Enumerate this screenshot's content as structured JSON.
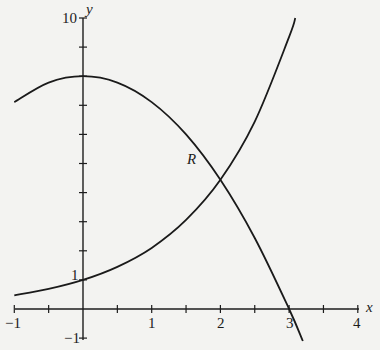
{
  "chart_data": {
    "type": "line",
    "title": "",
    "xlabel": "x",
    "ylabel": "y",
    "xlim": [
      -1,
      4
    ],
    "ylim": [
      -1,
      10
    ],
    "grid": false,
    "x_ticks": [
      -1,
      -0.5,
      0,
      0.5,
      1,
      1.5,
      2,
      2.5,
      3,
      3.5,
      4
    ],
    "x_tick_labels": [
      "-1",
      "1",
      "2",
      "3",
      "4"
    ],
    "x_tick_label_values": [
      -1,
      1,
      2,
      3,
      4
    ],
    "y_ticks": [
      -1,
      0,
      1,
      2,
      3,
      4,
      5,
      6,
      7,
      8,
      9,
      10
    ],
    "y_tick_labels": [
      "10",
      "1",
      "-1"
    ],
    "y_tick_label_values": [
      10,
      1,
      -1
    ],
    "series": [
      {
        "name": "increasing curve",
        "description": "passes through (0, 1), rises steeply past x = 3",
        "x": [
          -1,
          -0.5,
          0,
          0.5,
          1,
          1.5,
          2,
          2.5,
          3,
          3.09
        ],
        "y": [
          0.47,
          0.69,
          1.0,
          1.45,
          2.1,
          3.06,
          4.44,
          6.44,
          9.35,
          10.0
        ]
      },
      {
        "name": "decreasing curve",
        "description": "maximum near (0, 8), crosses x-axis at x = 3",
        "x": [
          -1,
          -0.5,
          0,
          0.5,
          1,
          1.5,
          2,
          2.5,
          3,
          3.2
        ],
        "y": [
          7.11,
          7.78,
          8.0,
          7.78,
          7.11,
          6.0,
          4.44,
          2.44,
          0.0,
          -1.1
        ]
      }
    ],
    "annotations": [
      {
        "text": "R",
        "x": 1.75,
        "y": 5.5,
        "meaning": "region bounded by the two curves, to the left of their intersection near x = 2"
      }
    ]
  },
  "labels": {
    "x_axis": "x",
    "y_axis": "y",
    "region": "R",
    "x_ticks": [
      "−1",
      "1",
      "2",
      "3",
      "4"
    ],
    "y_top": "10",
    "y_one": "1",
    "y_neg_one": "−1"
  }
}
